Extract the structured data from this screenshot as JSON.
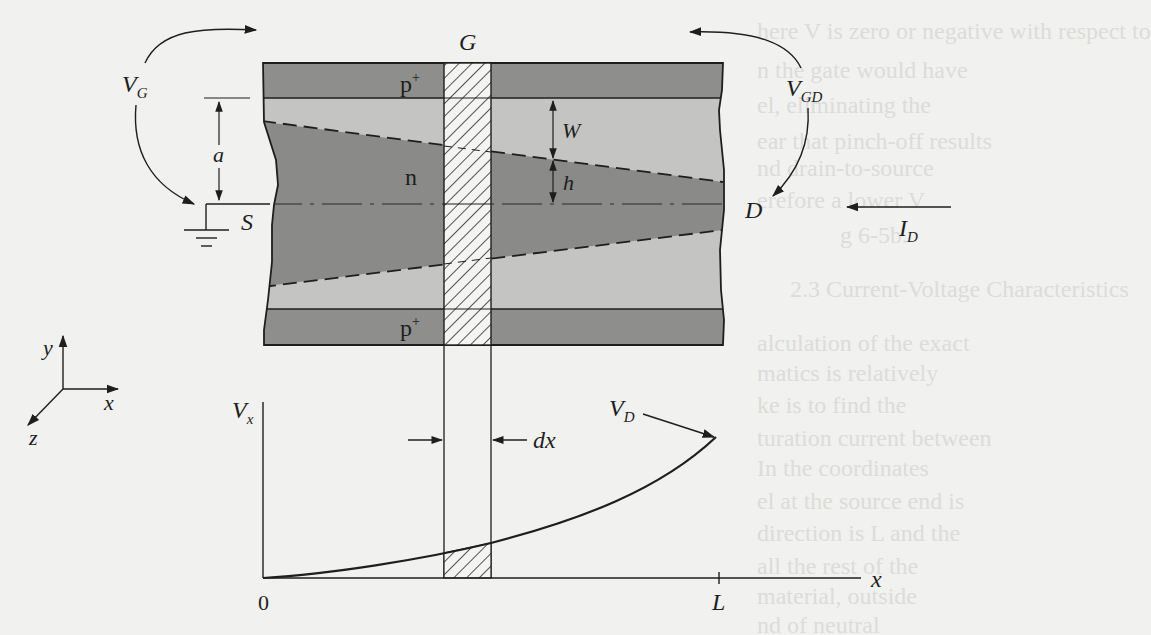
{
  "figure": {
    "terminals": {
      "gate": "G",
      "source": "S",
      "drain": "D"
    },
    "regions": {
      "top_layer": "p",
      "top_layer_sup": "+",
      "channel": "n",
      "bottom_layer": "p",
      "bottom_layer_sup": "+"
    },
    "voltages": {
      "vg_main": "V",
      "vg_sub": "G",
      "vgd_main": "V",
      "vgd_sub": "GD",
      "vd_main": "V",
      "vd_sub": "D"
    },
    "current": {
      "main": "I",
      "sub": "D"
    },
    "dimensions": {
      "channel_half_width": "a",
      "depletion_width": "W",
      "channel_half_height": "h",
      "slice_width": "dx"
    },
    "axes3d": {
      "y": "y",
      "x": "x",
      "z": "z"
    },
    "plot": {
      "ylabel_main": "V",
      "ylabel_sub": "x",
      "xlabel": "x",
      "origin": "0",
      "length_tick": "L"
    },
    "colors": {
      "p_plus": "#8e8e8c",
      "depletion": "#c4c4c2",
      "channel": "#8a8a88",
      "gate_hatch_bg": "#f4f4f2",
      "ink": "#1e1e1e",
      "page": "#f1f1ef"
    }
  },
  "background_text": {
    "lines": [
      "here V  is zero or negative with respect to",
      "n the gate would have",
      "el, eliminating the",
      "ear that pinch-off results",
      "nd drain-to-source",
      "erefore a lower V",
      "g 6-5b.",
      "2.3   Current-Voltage Characteristics",
      "alculation of the exact",
      "matics is relatively",
      "ke is to find the",
      "turation current between",
      "      In the coordinates",
      "el at the source end is",
      "direction is L and the",
      "all the rest of the",
      "material, outside",
      "nd of neutral"
    ]
  }
}
